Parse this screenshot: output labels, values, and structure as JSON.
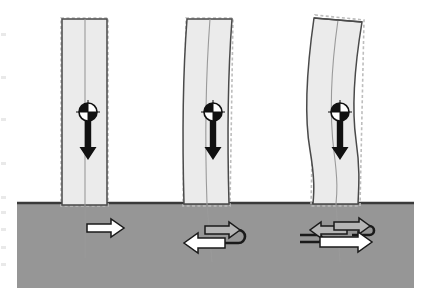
{
  "figure": {
    "canvas": {
      "width": 431,
      "height": 306,
      "background": "#ffffff"
    }
  },
  "colors": {
    "soil_fill": "#969696",
    "soil_edge": "#3a3a3a",
    "pile_fill": "#ebebeb",
    "pile_edge": "#4a4a4a",
    "original_outline": "#b8b8b8",
    "centerline": "#9a9a9a",
    "arrow_white": "#ffffff",
    "arrow_gray": "#b5b5b5",
    "arrow_edge": "#1a1a1a",
    "cg_black": "#111111",
    "cg_white": "#ffffff",
    "load_arrow": "#111111"
  },
  "soil_layer": {
    "name": "soil-layer",
    "label": "",
    "x": 17,
    "y": 202,
    "width": 397,
    "height": 86,
    "fill": "#969696"
  },
  "piles": [
    {
      "id": "pile-1",
      "mode": "rigid-translation",
      "label": "",
      "top_y": 18,
      "bottom_y": 203,
      "head_left": 61,
      "head_right": 108,
      "base_left": 61,
      "base_right": 108,
      "tilt": 0,
      "curvature": "straight",
      "centerline_x": 85,
      "centerline_bottom_y": 258,
      "cg": {
        "cx": 88,
        "cy": 112,
        "r": 9
      },
      "load_arrow": {
        "x": 88,
        "y_start": 121,
        "y_end": 160
      }
    },
    {
      "id": "pile-2",
      "mode": "single-curvature-bending",
      "label": "",
      "top_y": 18,
      "bottom_y": 203,
      "head_left": 186,
      "head_right": 233,
      "base_left": 183,
      "base_right": 230,
      "tilt": 0,
      "curvature": "single-bow",
      "centerline_x": 212,
      "centerline_bottom_y": 262,
      "cg": {
        "cx": 213,
        "cy": 112,
        "r": 9
      },
      "load_arrow": {
        "x": 213,
        "y_start": 121,
        "y_end": 160
      }
    },
    {
      "id": "pile-3",
      "mode": "double-curvature-bending",
      "label": "",
      "top_y": 18,
      "bottom_y": 203,
      "head_left": 313,
      "head_right": 362,
      "base_left": 310,
      "base_right": 358,
      "tilt": -3,
      "curvature": "s-shape",
      "centerline_x": 338,
      "centerline_bottom_y": 262,
      "cg": {
        "cx": 340,
        "cy": 112,
        "r": 9
      },
      "load_arrow": {
        "x": 340,
        "y_start": 121,
        "y_end": 160
      }
    }
  ],
  "cg_symbol": {
    "name": "center-of-gravity-symbol",
    "description": "quartered circle, top-left and bottom-right filled black",
    "quadrants": [
      "black",
      "white",
      "white",
      "black"
    ]
  },
  "reaction_groups": [
    {
      "id": "reaction-1",
      "pile": "pile-1",
      "type": "single-force",
      "arrows": [
        {
          "name": "soil-reaction-arrow-right",
          "direction": "right",
          "fill": "#ffffff",
          "tail_x": 87,
          "tip_x": 124,
          "y": 228,
          "shaft_half": 4,
          "head_half": 9,
          "head_len": 13
        }
      ],
      "loop": null
    },
    {
      "id": "reaction-2",
      "pile": "pile-2",
      "type": "couple",
      "arrows": [
        {
          "name": "soil-reaction-arrow-left-white",
          "direction": "left",
          "fill": "#ffffff",
          "tail_x": 225,
          "tip_x": 184,
          "y": 243,
          "shaft_half": 5,
          "head_half": 10,
          "head_len": 14
        },
        {
          "name": "soil-reaction-arrow-right-gray",
          "direction": "right",
          "fill": "#b5b5b5",
          "tail_x": 205,
          "tip_x": 240,
          "y": 230,
          "shaft_half": 4,
          "head_half": 8,
          "head_len": 11
        }
      ],
      "loop": {
        "name": "couple-loop",
        "x1": 222,
        "x2": 245,
        "y1": 230,
        "y2": 243
      }
    },
    {
      "id": "reaction-3",
      "pile": "pile-3",
      "type": "double-couple",
      "arrows": [
        {
          "name": "soil-reaction-arrow-left-gray",
          "direction": "left",
          "fill": "#b5b5b5",
          "tail_x": 347,
          "tip_x": 310,
          "y": 230,
          "shaft_half": 4,
          "head_half": 8,
          "head_len": 11
        },
        {
          "name": "soil-reaction-arrow-right-gray-upper",
          "direction": "right",
          "fill": "#b5b5b5",
          "tail_x": 334,
          "tip_x": 370,
          "y": 226,
          "shaft_half": 4,
          "head_half": 8,
          "head_len": 11
        },
        {
          "name": "soil-reaction-arrow-right-white",
          "direction": "right",
          "fill": "#ffffff",
          "tail_x": 320,
          "tip_x": 372,
          "y": 242,
          "shaft_half": 5,
          "head_half": 10,
          "head_len": 14
        }
      ],
      "loops": [
        {
          "name": "couple-loop-upper-right",
          "x1": 352,
          "x2": 374,
          "y1": 226,
          "y2": 235
        },
        {
          "name": "couple-loop-lower-left",
          "x1": 300,
          "x2": 322,
          "y1": 235,
          "y2": 242
        }
      ]
    }
  ],
  "scan_marks": {
    "name": "scan-edge-marks",
    "y_positions": [
      33,
      76,
      118,
      162,
      196,
      211,
      228,
      246,
      263
    ]
  }
}
